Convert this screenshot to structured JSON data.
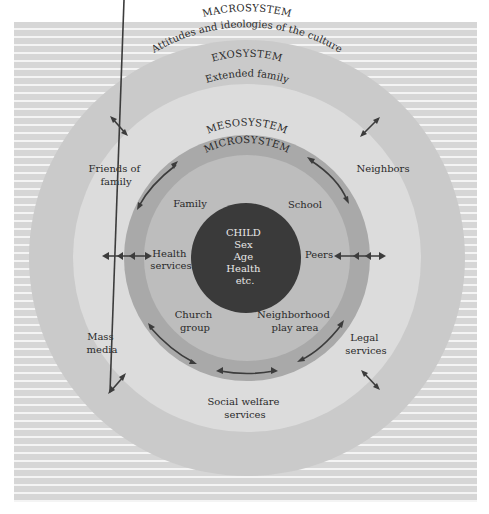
{
  "diagram": {
    "colors": {
      "background_stripe": "#d6d6d6",
      "macrosystem": "#cacaca",
      "exosystem": "#dcdcdc",
      "mesosystem": "#a9a9a9",
      "microsystem": "#bdbdbd",
      "child": "#3a3a3a"
    },
    "macrosystem": {
      "label": "MACROSYSTEM",
      "description": "Attitudes and ideologies of the culture",
      "items": [
        "Mass media",
        "Social welfare services",
        "Legal services"
      ]
    },
    "exosystem": {
      "label": "EXOSYSTEM",
      "items": {
        "extended_family": "Extended family",
        "friends_line1": "Friends of",
        "friends_line2": "family",
        "neighbors": "Neighbors",
        "mass_media_line1": "Mass",
        "mass_media_line2": "media",
        "legal_line1": "Legal",
        "legal_line2": "services",
        "social_line1": "Social welfare",
        "social_line2": "services"
      }
    },
    "mesosystem": {
      "label": "MESOSYSTEM"
    },
    "microsystem": {
      "label": "MICROSYSTEM",
      "items": {
        "family": "Family",
        "school": "School",
        "health_line1": "Health",
        "health_line2": "services",
        "peers": "Peers",
        "church_line1": "Church",
        "church_line2": "group",
        "neighborhood_line1": "Neighborhood",
        "neighborhood_line2": "play area"
      }
    },
    "child": {
      "lines": [
        "CHILD",
        "Sex",
        "Age",
        "Health",
        "etc."
      ]
    }
  }
}
